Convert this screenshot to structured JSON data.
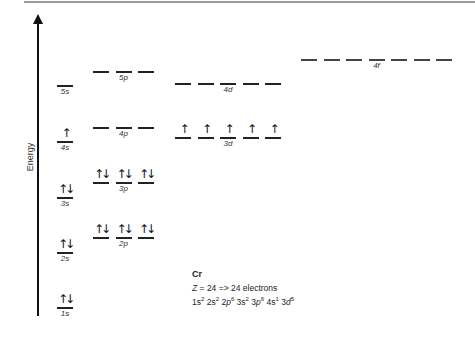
{
  "axis": {
    "label": "Energy",
    "direction": "up"
  },
  "element": {
    "symbol": "Cr",
    "z_line": "Z = 24 => 24 electrons",
    "config_parts": [
      {
        "orb": "1s",
        "e": "2"
      },
      {
        "orb": "2s",
        "e": "2"
      },
      {
        "orb": "2p",
        "e": "6"
      },
      {
        "orb": "3s",
        "e": "2"
      },
      {
        "orb": "3p",
        "e": "6"
      },
      {
        "orb": "4s",
        "e": "1"
      },
      {
        "orb": "3d",
        "e": "5"
      }
    ]
  },
  "levels": [
    {
      "name": "1s",
      "n": "1",
      "l": "s",
      "boxes": 1,
      "electrons": [
        "↑↓"
      ],
      "y": 307,
      "x": 57,
      "dashed": false
    },
    {
      "name": "2s",
      "n": "2",
      "l": "s",
      "boxes": 1,
      "electrons": [
        "↑↓"
      ],
      "y": 252,
      "x": 57,
      "dashed": false
    },
    {
      "name": "2p",
      "n": "2",
      "l": "p",
      "boxes": 3,
      "electrons": [
        "↑↓",
        "↑↓",
        "↑↓"
      ],
      "y": 237,
      "x": 93,
      "dashed": false
    },
    {
      "name": "3s",
      "n": "3",
      "l": "s",
      "boxes": 1,
      "electrons": [
        "↑↓"
      ],
      "y": 197,
      "x": 57,
      "dashed": false
    },
    {
      "name": "3p",
      "n": "3",
      "l": "p",
      "boxes": 3,
      "electrons": [
        "↑↓",
        "↑↓",
        "↑↓"
      ],
      "y": 182,
      "x": 93,
      "dashed": false
    },
    {
      "name": "4s",
      "n": "4",
      "l": "s",
      "boxes": 1,
      "electrons": [
        "↑"
      ],
      "y": 141,
      "x": 57,
      "dashed": false
    },
    {
      "name": "3d",
      "n": "3",
      "l": "d",
      "boxes": 5,
      "electrons": [
        "↑",
        "↑",
        "↑",
        "↑",
        "↑"
      ],
      "y": 137,
      "x": 175,
      "dashed": false
    },
    {
      "name": "4p",
      "n": "4",
      "l": "p",
      "boxes": 3,
      "electrons": [
        "",
        "",
        ""
      ],
      "y": 127,
      "x": 93,
      "dashed": false
    },
    {
      "name": "5s",
      "n": "5",
      "l": "s",
      "boxes": 1,
      "electrons": [
        ""
      ],
      "y": 85,
      "x": 57,
      "dashed": false
    },
    {
      "name": "4d",
      "n": "4",
      "l": "d",
      "boxes": 5,
      "electrons": [
        "",
        "",
        "",
        "",
        ""
      ],
      "y": 83,
      "x": 175,
      "dashed": false
    },
    {
      "name": "5p",
      "n": "5",
      "l": "p",
      "boxes": 3,
      "electrons": [
        "",
        "",
        ""
      ],
      "y": 71,
      "x": 93,
      "dashed": false
    },
    {
      "name": "4f",
      "n": "4",
      "l": "f",
      "boxes": 7,
      "electrons": [
        "",
        "",
        "",
        "",
        "",
        "",
        ""
      ],
      "y": 59,
      "x": 301,
      "dashed": true
    }
  ],
  "colors": {
    "line": "#222222",
    "axis": "#111111",
    "border": "#9a9a9a",
    "text": "#333333"
  }
}
